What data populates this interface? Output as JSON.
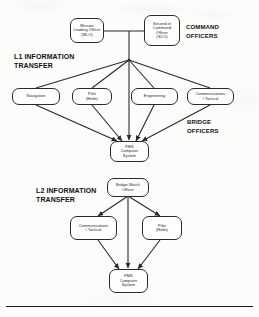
{
  "diagram": {
    "title_note": "Information transfer hierarchy diagram",
    "sections": [
      {
        "id": "l1",
        "label": "L1 INFORMATION\nTRANSFER"
      },
      {
        "id": "l2",
        "label": "L2 INFORMATION\nTRANSFER"
      }
    ],
    "group_labels": [
      {
        "id": "command",
        "label": "COMMAND\nOFFICERS"
      },
      {
        "id": "bridge",
        "label": "BRIDGE\nOFFICERS"
      }
    ],
    "l1_nodes": {
      "mlo": "Mission\nLeading Officer\n(MLO)",
      "sco": "Second in\nCommand\nOfficer\n(SCO)",
      "navigation": "Navigation",
      "pilot": "Pilot\n(Helm)",
      "engineering": "Engineering",
      "comms": "Communications\n/ Tactical",
      "fms": "FMS\nComputer\nSystem"
    },
    "l2_nodes": {
      "bwo": "Bridge Watch\nOfficer",
      "comms": "Communications\n/ Tactical",
      "pilot": "Pilot\n(Helm)",
      "fms": "FMS\nComputer\nSystem"
    },
    "colors": {
      "line": "#2a2a2a",
      "text": "#1a1a1a",
      "page": "#fcfcfb"
    }
  }
}
